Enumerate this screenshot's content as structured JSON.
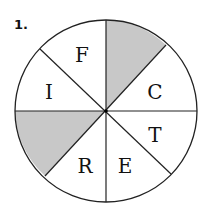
{
  "problem_number": "1.",
  "spinner": {
    "center": [
      106,
      111
    ],
    "radius": 91,
    "sectors": 8,
    "shaded_color": "#c8c8c8",
    "line_color": "#222222",
    "labels": [
      {
        "text": "F",
        "x": 82,
        "y": 62
      },
      {
        "text": "C",
        "x": 155,
        "y": 99
      },
      {
        "text": "T",
        "x": 155,
        "y": 142
      },
      {
        "text": "E",
        "x": 125,
        "y": 173
      },
      {
        "text": "R",
        "x": 85,
        "y": 173
      },
      {
        "text": "I",
        "x": 49,
        "y": 99
      }
    ],
    "shaded": [
      "top-right sector (N to NE)",
      "left-lower sector (W to SW)"
    ]
  }
}
